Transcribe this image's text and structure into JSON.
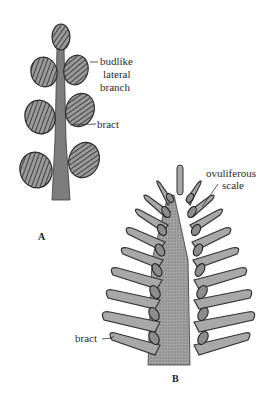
{
  "figure": {
    "panel_a": {
      "letter": "A",
      "labels": {
        "budlike_line1": "budlike",
        "budlike_line2": "lateral",
        "budlike_line3": "branch",
        "bract": "bract"
      }
    },
    "panel_b": {
      "letter": "B",
      "labels": {
        "ovuliferous_line1": "ovuliferous",
        "ovuliferous_line2": "scale",
        "bract": "bract"
      }
    },
    "colors": {
      "stem": "#7a7a7a",
      "bud_fill": "#8a8a8a",
      "bud_outline": "#2b2b2b",
      "scale_fill": "#a8a8a8",
      "axis_fill": "#9a9a9a",
      "ovule_fill": "#8c8c8c",
      "text": "#2a2a2a"
    }
  }
}
